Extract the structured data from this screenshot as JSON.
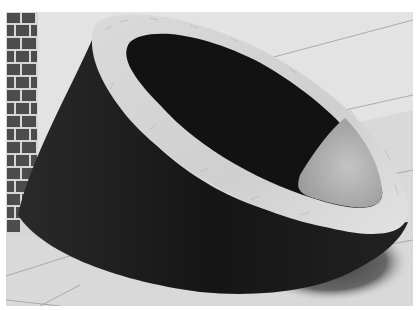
{
  "image": {
    "description": "Grayscale 3D render of an obliquely cut thick-walled cylinder (tube sliced at an angle) resting on a tiled floor next to a brick wall",
    "subject": "oblique-cut-cylinder",
    "colors": {
      "background_margin": "#ffffff",
      "wall_plaster": "#e4e4e4",
      "floor": "#dcdcdc",
      "floor_lines": "#9a9a9a",
      "brick_dark": "#4a4a4a",
      "brick_mortar": "#d8d8d8",
      "body_dark": "#1c1c1c",
      "inner_dark": "#111111",
      "inner_lit": "#b8b8b8",
      "rim": "#d6d6d6",
      "shadow": "#555555"
    }
  }
}
